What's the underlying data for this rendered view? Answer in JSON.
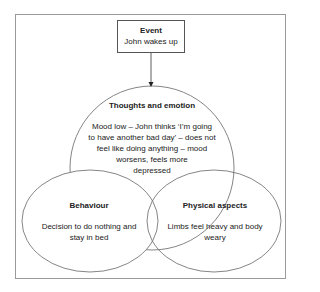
{
  "diagram": {
    "event": {
      "title": "Event",
      "text": "John wakes up"
    },
    "thoughts": {
      "title": "Thoughts and emotion",
      "lines": [
        "Mood low – John thinks ‘I’m going",
        "to have another bad day’ – does not",
        "feel like doing anything – mood",
        "worsens, feels more",
        "depressed"
      ]
    },
    "behaviour": {
      "title": "Behaviour",
      "lines": [
        "Decision to do nothing and",
        "stay in bed"
      ]
    },
    "physical": {
      "title": "Physical aspects",
      "lines": [
        "Limbs feel heavy and body",
        "weary"
      ]
    },
    "colors": {
      "frame": "#9a9a9a",
      "stroke": "#555555"
    }
  }
}
